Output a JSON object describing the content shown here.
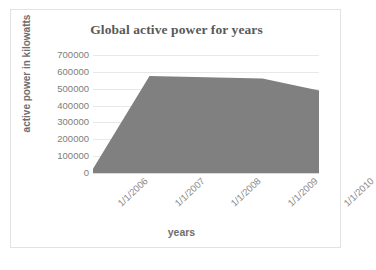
{
  "chart_data": {
    "type": "area",
    "title": "Global active power for years",
    "xlabel": "years",
    "ylabel": "active power in kilowatts",
    "categories": [
      "1/1/2006",
      "1/1/2007",
      "1/1/2008",
      "1/1/2009",
      "1/1/2010"
    ],
    "values": [
      25000,
      575000,
      568000,
      560000,
      490000
    ],
    "series": [
      {
        "name": "Global active power",
        "values": [
          25000,
          575000,
          568000,
          560000,
          490000
        ]
      }
    ],
    "ylim": [
      0,
      700000
    ],
    "yticks": [
      0,
      100000,
      200000,
      300000,
      400000,
      500000,
      600000,
      700000
    ],
    "ytick_labels": [
      "0",
      "100000",
      "200000",
      "300000",
      "400000",
      "500000",
      "600000",
      "700000"
    ],
    "grid": true,
    "legend": false,
    "series_color": "#808080",
    "grid_color": "#e8e8e8",
    "title_color": "#595959",
    "axis_label_color": "#7d7d7d"
  }
}
